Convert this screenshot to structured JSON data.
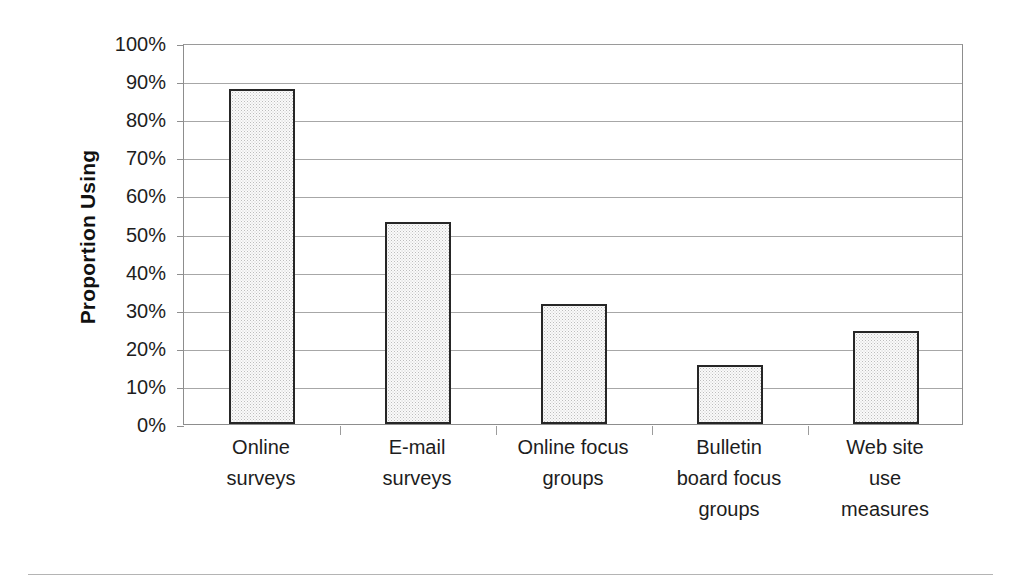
{
  "chart_data": {
    "type": "bar",
    "title": "",
    "xlabel": "",
    "ylabel": "Proportion Using",
    "categories": [
      "Online surveys",
      "E-mail surveys",
      "Online focus groups",
      "Bulletin board focus groups",
      "Web site use measures"
    ],
    "category_lines": [
      [
        "Online",
        "surveys"
      ],
      [
        "E-mail",
        "surveys"
      ],
      [
        "Online focus",
        "groups"
      ],
      [
        "Bulletin",
        "board focus",
        "groups"
      ],
      [
        "Web site",
        "use",
        "measures"
      ]
    ],
    "values": [
      88,
      53,
      31.5,
      15.5,
      24.5
    ],
    "value_labels": [
      "88%",
      "53%",
      "31.5%",
      "15.5%",
      "24.5%"
    ],
    "ylim": [
      0,
      100
    ],
    "ytick_values": [
      100,
      90,
      80,
      70,
      60,
      50,
      40,
      30,
      20,
      10,
      0
    ],
    "ytick_labels": [
      "100%",
      "90%",
      "80%",
      "70%",
      "60%",
      "50%",
      "40%",
      "30%",
      "20%",
      "10%",
      "0%"
    ],
    "grid": true,
    "legend": false,
    "legend_position": "none",
    "bar_fill": "#fafafa",
    "bar_border_color": "#262626",
    "gridline_color": "#a7a7a7",
    "axis_color": "#8d8d8d",
    "background": "#ffffff",
    "text_color": "#1d1d1d"
  }
}
